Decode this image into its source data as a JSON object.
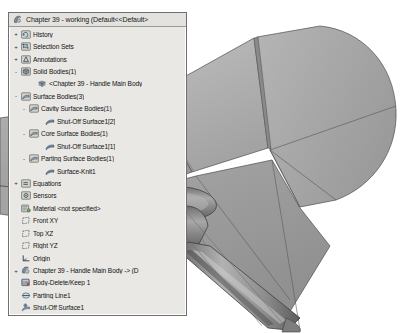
{
  "window": {
    "title": "Chapter 39 - working  (Default<<Default>",
    "app": "SolidWorks FeatureManager design tree"
  },
  "colors": {
    "panel_bg": "#e9e8e4",
    "panel_border": "#6f6f6f",
    "title_bg": "#e3e2de",
    "text": "#111315",
    "model_light": "#b9b9b9",
    "model_mid": "#9d9d9d",
    "model_dark": "#7b7b7b",
    "model_edge": "#4a4a4a",
    "viewport_bg": "#ffffff"
  },
  "tree": {
    "nodes": [
      {
        "label": "Chapter 39 - working  (Default<<Default>",
        "indent": 0,
        "twisty": "",
        "icon": "document-icon",
        "role": "title"
      },
      {
        "label": "History",
        "indent": 0,
        "twisty": "+",
        "icon": "history-icon"
      },
      {
        "label": "Selection Sets",
        "indent": 0,
        "twisty": "+",
        "icon": "selection-sets-icon"
      },
      {
        "label": "Annotations",
        "indent": 0,
        "twisty": "+",
        "icon": "annotations-icon"
      },
      {
        "label": "Solid Bodies(1)",
        "indent": 0,
        "twisty": "-",
        "icon": "solid-bodies-icon"
      },
      {
        "label": "<Chapter  39 - Handle Main Body",
        "indent": 2,
        "twisty": "",
        "icon": "solid-body-icon"
      },
      {
        "label": "Surface Bodies(3)",
        "indent": 0,
        "twisty": "-",
        "icon": "surface-bodies-icon"
      },
      {
        "label": "Cavity Surface Bodies(1)",
        "indent": 1,
        "twisty": "-",
        "icon": "surface-bodies-icon"
      },
      {
        "label": "Shut-Off Surface1[2]",
        "indent": 3,
        "twisty": "",
        "icon": "surface-icon"
      },
      {
        "label": "Core Surface Bodies(1)",
        "indent": 1,
        "twisty": "-",
        "icon": "surface-bodies-icon"
      },
      {
        "label": "Shut-Off Surface1[1]",
        "indent": 3,
        "twisty": "",
        "icon": "surface-icon"
      },
      {
        "label": "Parting Surface Bodies(1)",
        "indent": 1,
        "twisty": "-",
        "icon": "surface-bodies-icon"
      },
      {
        "label": "Surface-Knit1",
        "indent": 3,
        "twisty": "",
        "icon": "surface-icon"
      },
      {
        "label": "Equations",
        "indent": 0,
        "twisty": "+",
        "icon": "equations-icon"
      },
      {
        "label": "Sensors",
        "indent": 0,
        "twisty": "",
        "icon": "sensors-icon"
      },
      {
        "label": "Material <not specified>",
        "indent": 0,
        "twisty": "",
        "icon": "material-icon"
      },
      {
        "label": "Front XY",
        "indent": 0,
        "twisty": "",
        "icon": "plane-icon"
      },
      {
        "label": "Top XZ",
        "indent": 0,
        "twisty": "",
        "icon": "plane-icon"
      },
      {
        "label": "Right YZ",
        "indent": 0,
        "twisty": "",
        "icon": "plane-icon"
      },
      {
        "label": "Origin",
        "indent": 0,
        "twisty": "",
        "icon": "origin-icon"
      },
      {
        "label": "Chapter  39 - Handle Main Body -> (D",
        "indent": 0,
        "twisty": "+",
        "icon": "part-icon"
      },
      {
        "label": "Body-Delete/Keep 1",
        "indent": 0,
        "twisty": "",
        "icon": "body-delete-keep-icon"
      },
      {
        "label": "Parting Line1",
        "indent": 0,
        "twisty": "",
        "icon": "parting-line-icon"
      },
      {
        "label": "Shut-Off Surface1",
        "indent": 0,
        "twisty": "",
        "icon": "shut-off-surface-icon"
      },
      {
        "label": "Parting Surface1",
        "indent": 0,
        "twisty": "",
        "icon": "parting-surface-icon"
      },
      {
        "label": "Body-Delete/Keep 2",
        "indent": 0,
        "twisty": "",
        "icon": "body-delete-keep-icon"
      },
      {
        "label": "Boundary-Surface1",
        "indent": 0,
        "twisty": "",
        "icon": "boundary-surface-icon"
      },
      {
        "label": "Surface-Knit1",
        "indent": 0,
        "twisty": "",
        "icon": "surface-knit-icon"
      }
    ]
  },
  "viewport": {
    "label": "3d-model-view",
    "description": "Shaded grey mold parting surface model of a handle"
  }
}
